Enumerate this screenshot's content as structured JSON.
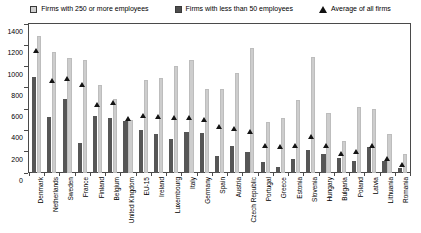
{
  "legend": {
    "items": [
      {
        "label": "Firms with 250 or more employees",
        "marker": "square-light-icon",
        "color": "#cfcfcf"
      },
      {
        "label": "Firms with less than 50 employees",
        "marker": "square-dark-icon",
        "color": "#4d4d4d"
      },
      {
        "label": "Average of all firms",
        "marker": "triangle-icon",
        "color": "#111111"
      }
    ]
  },
  "yaxis": {
    "ticks": [
      1400,
      1200,
      1000,
      800,
      600,
      400,
      200,
      0
    ]
  },
  "chart_data": {
    "type": "bar",
    "title": "",
    "xlabel": "",
    "ylabel": "",
    "ylim": [
      0,
      1400
    ],
    "ytick_step": 200,
    "grid": false,
    "legend_position": "top",
    "categories": [
      "Denmark",
      "Netherlands",
      "Sweden",
      "France",
      "Finland",
      "Belgium",
      "United Kingdom",
      "EU-15",
      "Ireland",
      "Luxembourg",
      "Italy",
      "Germany",
      "Spain",
      "Austria",
      "Czech Republic",
      "Portugal",
      "Greece",
      "Estonia",
      "Slovenia",
      "Hungary",
      "Bulgaria",
      "Poland",
      "Latvia",
      "Lithuania",
      "Romania"
    ],
    "series": [
      {
        "name": "Firms with 250 or more employees",
        "color": "#cdcdcd",
        "values": [
          1290,
          1140,
          1080,
          1060,
          830,
          700,
          500,
          870,
          890,
          1010,
          1060,
          790,
          790,
          940,
          1170,
          480,
          520,
          690,
          1090,
          560,
          300,
          620,
          600,
          370,
          180
        ]
      },
      {
        "name": "Firms with less than 50 employees",
        "color": "#565656",
        "values": [
          900,
          530,
          700,
          280,
          540,
          520,
          490,
          400,
          370,
          320,
          390,
          380,
          160,
          250,
          200,
          100,
          60,
          130,
          220,
          180,
          140,
          110,
          240,
          110,
          50
        ]
      },
      {
        "name": "Average of all firms",
        "type": "marker-triangle",
        "color": "#141414",
        "values": [
          1150,
          870,
          890,
          830,
          640,
          660,
          510,
          540,
          530,
          520,
          520,
          500,
          440,
          420,
          390,
          260,
          250,
          260,
          340,
          260,
          180,
          200,
          260,
          140,
          80
        ]
      }
    ]
  }
}
